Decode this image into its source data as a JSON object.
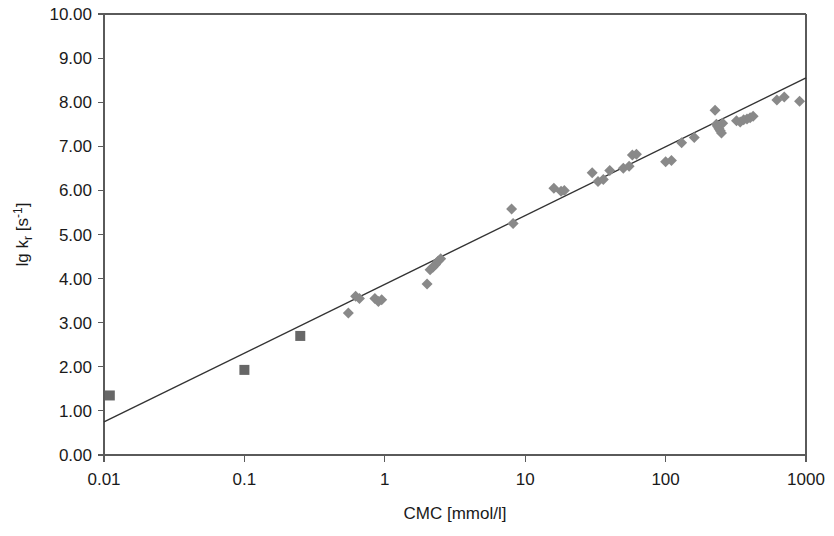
{
  "chart_data": {
    "type": "scatter",
    "title": "",
    "xlabel": "CMC [mmol/l]",
    "ylabel": "lg kr [s-1]",
    "ylabel_parts": {
      "lead": "lg k",
      "sub": "r",
      "mid": " [s",
      "sup": "-1",
      "tail": "]"
    },
    "xscale": "log",
    "yscale": "linear",
    "xlim": [
      0.01,
      1000
    ],
    "ylim": [
      0.0,
      10.0
    ],
    "grid": false,
    "legend": "none",
    "xticks": [
      0.01,
      0.1,
      1,
      10,
      100,
      1000
    ],
    "xticklabels": [
      "0.01",
      "0.1",
      "1",
      "10",
      "100",
      "1000"
    ],
    "yticks": [
      0.0,
      1.0,
      2.0,
      3.0,
      4.0,
      5.0,
      6.0,
      7.0,
      8.0,
      9.0,
      10.0
    ],
    "yticklabels": [
      "0.00",
      "1.00",
      "2.00",
      "3.00",
      "4.00",
      "5.00",
      "6.00",
      "7.00",
      "8.00",
      "9.00",
      "10.00"
    ],
    "trendline": {
      "type": "linear-in-log-x",
      "x_start": 0.01,
      "y_start": 0.75,
      "x_end": 1000,
      "y_end": 8.55,
      "slope_per_decade": 1.56,
      "intercept_at_x1": 3.87
    },
    "series": [
      {
        "name": "square-markers",
        "marker": "square",
        "color": "#676767",
        "points": [
          {
            "x": 0.011,
            "y": 1.35
          },
          {
            "x": 0.1,
            "y": 1.93
          },
          {
            "x": 0.25,
            "y": 2.7
          }
        ]
      },
      {
        "name": "diamond-markers",
        "marker": "diamond",
        "color": "#898989",
        "points": [
          {
            "x": 0.55,
            "y": 3.22
          },
          {
            "x": 0.62,
            "y": 3.6
          },
          {
            "x": 0.66,
            "y": 3.55
          },
          {
            "x": 0.85,
            "y": 3.55
          },
          {
            "x": 0.9,
            "y": 3.48
          },
          {
            "x": 0.95,
            "y": 3.52
          },
          {
            "x": 2.0,
            "y": 3.88
          },
          {
            "x": 2.1,
            "y": 4.2
          },
          {
            "x": 2.2,
            "y": 4.26
          },
          {
            "x": 2.3,
            "y": 4.32
          },
          {
            "x": 2.4,
            "y": 4.4
          },
          {
            "x": 2.5,
            "y": 4.45
          },
          {
            "x": 8.0,
            "y": 5.58
          },
          {
            "x": 8.2,
            "y": 5.25
          },
          {
            "x": 16.0,
            "y": 6.05
          },
          {
            "x": 18.0,
            "y": 5.98
          },
          {
            "x": 19.0,
            "y": 6.0
          },
          {
            "x": 30.0,
            "y": 6.4
          },
          {
            "x": 33.0,
            "y": 6.2
          },
          {
            "x": 36.0,
            "y": 6.25
          },
          {
            "x": 40.0,
            "y": 6.45
          },
          {
            "x": 50.0,
            "y": 6.5
          },
          {
            "x": 55.0,
            "y": 6.55
          },
          {
            "x": 58.0,
            "y": 6.8
          },
          {
            "x": 62.0,
            "y": 6.82
          },
          {
            "x": 100.0,
            "y": 6.65
          },
          {
            "x": 110.0,
            "y": 6.68
          },
          {
            "x": 130.0,
            "y": 7.08
          },
          {
            "x": 160.0,
            "y": 7.2
          },
          {
            "x": 225.0,
            "y": 7.82
          },
          {
            "x": 230.0,
            "y": 7.5
          },
          {
            "x": 235.0,
            "y": 7.45
          },
          {
            "x": 240.0,
            "y": 7.4
          },
          {
            "x": 245.0,
            "y": 7.35
          },
          {
            "x": 250.0,
            "y": 7.3
          },
          {
            "x": 255.0,
            "y": 7.52
          },
          {
            "x": 320.0,
            "y": 7.58
          },
          {
            "x": 340.0,
            "y": 7.55
          },
          {
            "x": 360.0,
            "y": 7.6
          },
          {
            "x": 380.0,
            "y": 7.62
          },
          {
            "x": 400.0,
            "y": 7.65
          },
          {
            "x": 420.0,
            "y": 7.68
          },
          {
            "x": 620.0,
            "y": 8.05
          },
          {
            "x": 700.0,
            "y": 8.12
          },
          {
            "x": 900.0,
            "y": 8.02
          }
        ]
      }
    ]
  }
}
